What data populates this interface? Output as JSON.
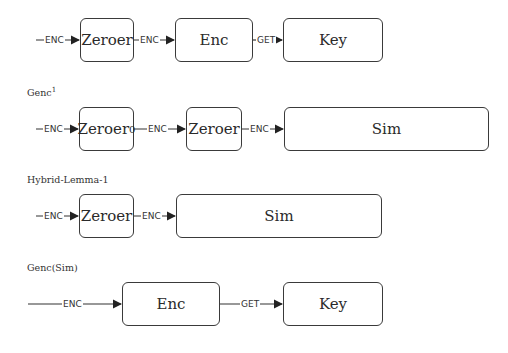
{
  "rows": [
    {
      "title": "",
      "boxes": [
        {
          "label": "Zeroer",
          "sub": ""
        },
        {
          "label": "Enc",
          "sub": ""
        },
        {
          "label": "Key",
          "sub": ""
        }
      ],
      "edges": [
        "ENC",
        "ENC",
        "GET"
      ]
    },
    {
      "title": "Genc",
      "title_sup": "1",
      "boxes": [
        {
          "label": "Zeroer",
          "sub": "0"
        },
        {
          "label": "Zeroer",
          "sub": ""
        },
        {
          "label": "Sim",
          "sub": ""
        }
      ],
      "edges": [
        "ENC",
        "ENC",
        "ENC"
      ]
    },
    {
      "title": "Hybrid-Lemma-1",
      "boxes": [
        {
          "label": "Zeroer",
          "sub": ""
        },
        {
          "label": "Sim",
          "sub": ""
        }
      ],
      "edges": [
        "ENC",
        "ENC"
      ]
    },
    {
      "title": "Genc(Sim)",
      "boxes": [
        {
          "label": "Enc",
          "sub": ""
        },
        {
          "label": "Key",
          "sub": ""
        }
      ],
      "edges": [
        "ENC",
        "GET"
      ]
    }
  ]
}
